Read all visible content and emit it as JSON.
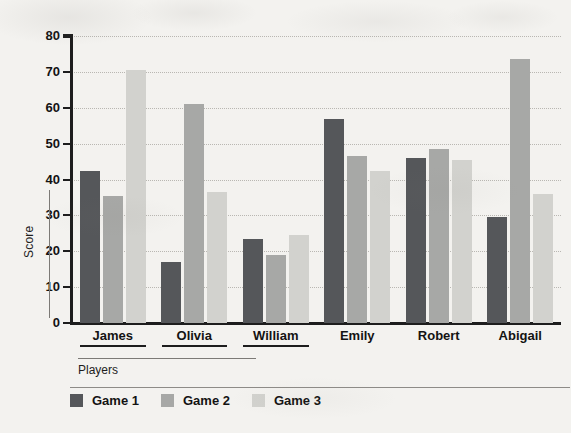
{
  "chart_data": {
    "type": "bar",
    "title": "",
    "xlabel": "Players",
    "ylabel": "Score",
    "ylim": [
      0,
      80
    ],
    "yticks": [
      0,
      10,
      20,
      30,
      40,
      50,
      60,
      70,
      80
    ],
    "grid": true,
    "legend_position": "bottom-left",
    "categories": [
      "James",
      "Olivia",
      "William",
      "Emily",
      "Robert",
      "Abigail"
    ],
    "series": [
      {
        "name": "Game 1",
        "color": "#55575a",
        "values": [
          42.5,
          17,
          23.5,
          57,
          46,
          29.5
        ]
      },
      {
        "name": "Game 2",
        "color": "#a7a8a6",
        "values": [
          35.5,
          61,
          19,
          46.5,
          48.5,
          73.5
        ]
      },
      {
        "name": "Game 3",
        "color": "#d2d2ce",
        "values": [
          70.5,
          36.5,
          24.5,
          42.5,
          45.5,
          36
        ]
      }
    ]
  },
  "axes": {
    "y_title": "Score",
    "x_title": "Players"
  }
}
